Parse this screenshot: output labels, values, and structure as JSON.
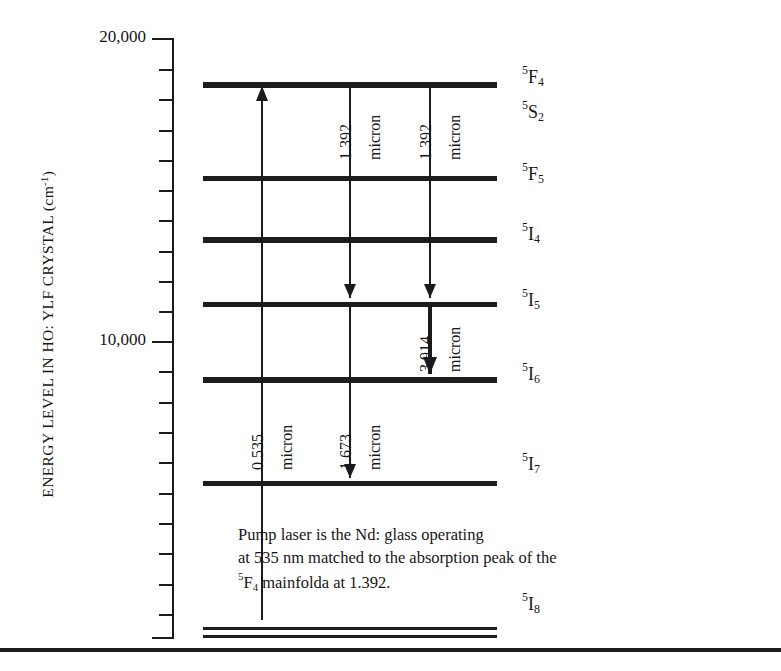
{
  "figure": {
    "axis_title": "ENERGY LEVEL IN HO: YLF CRYSTAL (cm",
    "axis_title_exponent": "-1",
    "axis_title_close": ")"
  },
  "axis": {
    "ticks": [
      {
        "label": "20,000",
        "value": 20000,
        "major": true,
        "y": 38
      },
      {
        "label": "",
        "value": 19000,
        "major": false,
        "y": 69
      },
      {
        "label": "",
        "value": 18000,
        "major": false,
        "y": 99
      },
      {
        "label": "",
        "value": 17000,
        "major": false,
        "y": 130
      },
      {
        "label": "",
        "value": 16000,
        "major": false,
        "y": 160
      },
      {
        "label": "",
        "value": 15000,
        "major": false,
        "y": 190
      },
      {
        "label": "",
        "value": 14000,
        "major": false,
        "y": 220
      },
      {
        "label": "",
        "value": 13000,
        "major": false,
        "y": 251
      },
      {
        "label": "",
        "value": 12000,
        "major": false,
        "y": 281
      },
      {
        "label": "",
        "value": 11000,
        "major": false,
        "y": 311
      },
      {
        "label": "10,000",
        "value": 10000,
        "major": true,
        "y": 341
      },
      {
        "label": "",
        "value": 9000,
        "major": false,
        "y": 371
      },
      {
        "label": "",
        "value": 8000,
        "major": false,
        "y": 402
      },
      {
        "label": "",
        "value": 7000,
        "major": false,
        "y": 432
      },
      {
        "label": "",
        "value": 6000,
        "major": false,
        "y": 462
      },
      {
        "label": "",
        "value": 5000,
        "major": false,
        "y": 493
      },
      {
        "label": "",
        "value": 4000,
        "major": false,
        "y": 523
      },
      {
        "label": "",
        "value": 3000,
        "major": false,
        "y": 553
      },
      {
        "label": "",
        "value": 2000,
        "major": false,
        "y": 584
      },
      {
        "label": "",
        "value": 1000,
        "major": false,
        "y": 614
      },
      {
        "label": "",
        "value": 0,
        "major": true,
        "y": 637
      }
    ]
  },
  "chart_data": {
    "type": "diagram",
    "ylabel": "ENERGY LEVEL IN HO: YLF CRYSTAL (cm^-1)",
    "ylim": [
      0,
      20000
    ],
    "y_ticks_labeled": [
      "20,000",
      "10,000"
    ],
    "levels": [
      {
        "name": "5F4",
        "label_pre": "5",
        "label_main": "F",
        "label_sub": "4",
        "energy": 18550,
        "y": 82,
        "x1": 203,
        "x2": 497,
        "thickness": 6,
        "label_y": 65
      },
      {
        "name": "5S2",
        "label_pre": "5",
        "label_main": "S",
        "label_sub": "2",
        "energy": 18400,
        "y": 82,
        "x1": 203,
        "x2": 497,
        "thickness": 0,
        "label_y": 100
      },
      {
        "name": "5F5",
        "label_pre": "5",
        "label_main": "F",
        "label_sub": "5",
        "energy": 15440,
        "y": 176,
        "x1": 203,
        "x2": 497,
        "thickness": 5,
        "label_y": 162
      },
      {
        "name": "5I4",
        "label_pre": "5",
        "label_main": "I",
        "label_sub": "4",
        "energy": 13430,
        "y": 237,
        "x1": 203,
        "x2": 497,
        "thickness": 6,
        "label_y": 222
      },
      {
        "name": "5I5",
        "label_pre": "5",
        "label_main": "I",
        "label_sub": "5",
        "energy": 11280,
        "y": 302,
        "x1": 203,
        "x2": 497,
        "thickness": 5,
        "label_y": 288
      },
      {
        "name": "5I6",
        "label_pre": "5",
        "label_main": "I",
        "label_sub": "6",
        "energy": 8800,
        "y": 377,
        "x1": 203,
        "x2": 497,
        "thickness": 6,
        "label_y": 362
      },
      {
        "name": "5I7",
        "label_pre": "5",
        "label_main": "I",
        "label_sub": "7",
        "energy": 5350,
        "y": 481,
        "x1": 203,
        "x2": 497,
        "thickness": 5,
        "label_y": 452
      },
      {
        "name": "5I8-upper",
        "label_pre": "",
        "label_main": "",
        "label_sub": "",
        "energy": 350,
        "y": 627,
        "x1": 203,
        "x2": 497,
        "thickness": 3,
        "label_y": 0
      },
      {
        "name": "5I8",
        "label_pre": "5",
        "label_main": "I",
        "label_sub": "8",
        "energy": 90,
        "y": 635,
        "x1": 203,
        "x2": 497,
        "thickness": 3,
        "label_y": 592
      }
    ],
    "transitions": [
      {
        "name": "pump-0535",
        "wavelength": "0.535",
        "unit": "micron",
        "x": 262,
        "y_from": 620,
        "y_to": 86,
        "direction": "up",
        "bold": false,
        "label_x": 250,
        "label_y": 470,
        "unit_x": 279,
        "unit_y": 470
      },
      {
        "name": "emission-1392-a",
        "wavelength": "1.392",
        "unit": "micron",
        "x": 350,
        "y_from": 85,
        "y_to": 298,
        "direction": "down",
        "bold": false,
        "label_x": 338,
        "label_y": 160,
        "unit_x": 367,
        "unit_y": 160
      },
      {
        "name": "emission-1392-b",
        "wavelength": "1.392",
        "unit": "micron",
        "x": 430,
        "y_from": 85,
        "y_to": 298,
        "direction": "down",
        "bold": false,
        "label_x": 418,
        "label_y": 160,
        "unit_x": 447,
        "unit_y": 160
      },
      {
        "name": "emission-3914",
        "wavelength": "3.914",
        "unit": "micron",
        "x": 430,
        "y_from": 305,
        "y_to": 374,
        "direction": "down",
        "bold": true,
        "label_x": 418,
        "label_y": 372,
        "unit_x": 447,
        "unit_y": 372
      },
      {
        "name": "emission-1673",
        "wavelength": "1.673",
        "unit": "micron",
        "x": 350,
        "y_from": 305,
        "y_to": 478,
        "direction": "down",
        "bold": false,
        "label_x": 338,
        "label_y": 470,
        "unit_x": 367,
        "unit_y": 470
      }
    ]
  },
  "caption": {
    "line1": "Pump laser is the Nd: glass operating",
    "line2": "at 535 nm matched to the absorption peak of the",
    "line3_pre": "5",
    "line3_main": "F",
    "line3_sub": "4",
    "line3_rest": " mainfolda at 1.392."
  },
  "colors": {
    "ink": "#1d1d1d",
    "background": "#ffffff"
  }
}
